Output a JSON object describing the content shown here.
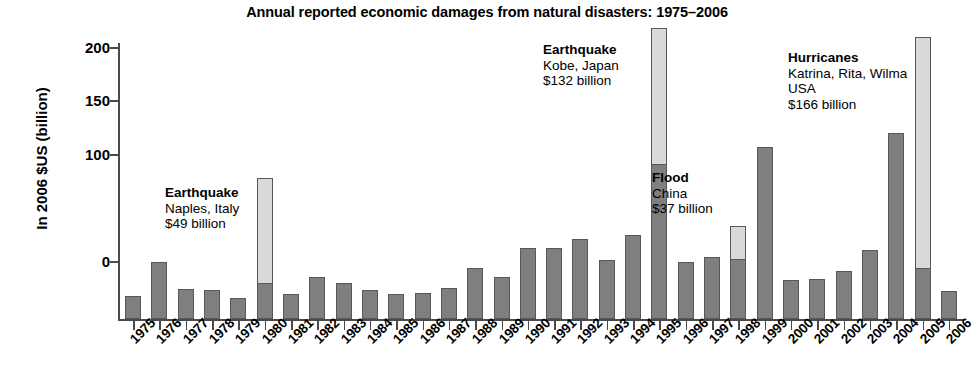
{
  "chart_data": {
    "type": "bar",
    "title": "Annual reported economic damages from natural disasters: 1975–2006",
    "xlabel": "",
    "ylabel": "In 2006 $US (billion)",
    "ylim": [
      -40,
      250
    ],
    "ytick_values": [
      0,
      100,
      150,
      200,
      250
    ],
    "ytick_labels": [
      "0",
      "100",
      "150",
      "200",
      "250"
    ],
    "grid": false,
    "legend": "none",
    "categories": [
      "1975",
      "1976",
      "1977",
      "1978",
      "1979",
      "1980",
      "1981",
      "1982",
      "1983",
      "1984",
      "1985",
      "1986",
      "1987",
      "1988",
      "1989",
      "1990",
      "1991",
      "1992",
      "1993",
      "1994",
      "1995",
      "1996",
      "1997",
      "1998",
      "1999",
      "2000",
      "2001",
      "2002",
      "2003",
      "2004",
      "2005",
      "2006"
    ],
    "series": [
      {
        "name": "Reported economic damages (base)",
        "color": "#7f7f80",
        "values": [
          -32,
          0,
          -25,
          -26,
          -34,
          -20,
          -30,
          -14,
          -20,
          -26,
          -30,
          -29,
          -24,
          -6,
          -14,
          13,
          13,
          21,
          2,
          25,
          91,
          0,
          5,
          3,
          107,
          -17,
          -16,
          -8,
          11,
          120,
          -6,
          -27
        ]
      },
      {
        "name": "Single catastrophic event (highlighted)",
        "color": "#d9d9d9",
        "values": [
          null,
          null,
          null,
          null,
          null,
          78,
          null,
          null,
          null,
          null,
          null,
          null,
          null,
          null,
          null,
          null,
          null,
          null,
          null,
          null,
          218,
          null,
          null,
          34,
          null,
          null,
          null,
          null,
          null,
          null,
          210,
          null
        ]
      }
    ],
    "annotations": [
      {
        "id": "naples",
        "head": "Earthquake",
        "lines": [
          "Naples, Italy",
          "$49 billion"
        ],
        "year": "1980",
        "amount": "$49 billion"
      },
      {
        "id": "kobe",
        "head": "Earthquake",
        "lines": [
          "Kobe, Japan",
          "$132 billion"
        ],
        "year": "1995",
        "amount": "$132 billion"
      },
      {
        "id": "china-flood",
        "head": "Flood",
        "lines": [
          "China",
          "$37 billion"
        ],
        "year": "1998",
        "amount": "$37 billion"
      },
      {
        "id": "hurricanes",
        "head": "Hurricanes",
        "lines": [
          "Katrina, Rita, Wilma",
          "USA",
          "$166 billion"
        ],
        "year": "2005",
        "amount": "$166 billion"
      }
    ],
    "colors": {
      "bar_base": "#7f7f80",
      "bar_highlight": "#d9d9d9",
      "bar_outline": "#58585a",
      "axis": "#4a4a4a",
      "text": "#000000"
    }
  }
}
